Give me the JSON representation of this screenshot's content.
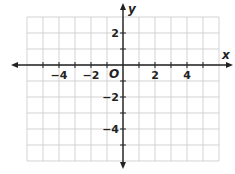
{
  "chart_data": {
    "type": "coordinate-grid",
    "title": "",
    "xlabel": "x",
    "ylabel": "y",
    "origin_label": "O",
    "xlim": [
      -6,
      6
    ],
    "ylim": [
      -6,
      3
    ],
    "grid": true,
    "grid_step": 1,
    "x_tick_labels": [
      {
        "value": -4,
        "text": "−4"
      },
      {
        "value": -2,
        "text": "−2"
      },
      {
        "value": 2,
        "text": "2"
      },
      {
        "value": 4,
        "text": "4"
      }
    ],
    "y_tick_labels": [
      {
        "value": 2,
        "text": "2"
      },
      {
        "value": -2,
        "text": "−2"
      },
      {
        "value": -4,
        "text": "−4"
      }
    ],
    "series": []
  },
  "colors": {
    "grid": "#c8c8c8",
    "axis": "#222222",
    "background": "#ffffff"
  }
}
